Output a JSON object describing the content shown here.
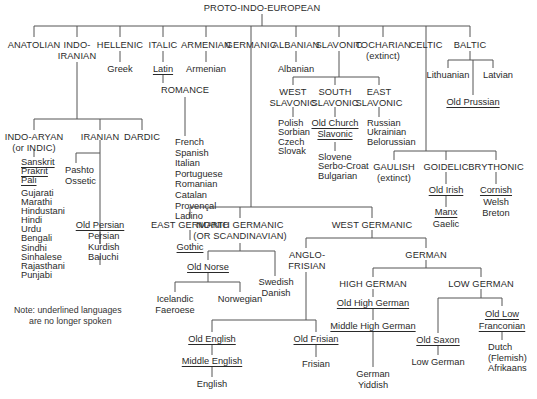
{
  "title": "PROTO-INDO-EUROPEAN",
  "note": {
    "line1": "Note: underlined languages",
    "line2": "are no longer spoken"
  },
  "branches": {
    "anatolian": "ANATOLIAN",
    "indo_iranian": [
      "INDO-",
      "IRANIAN"
    ],
    "hellenic": "HELLENIC",
    "italic": "ITALIC",
    "armenian": "ARMENIAN",
    "germanic": "GERMANIC",
    "albanian": "ALBANIAN",
    "slavonic": "SLAVONIC",
    "tocharian": [
      "TOCHARIAN",
      "(extinct)"
    ],
    "celtic": "CELTIC",
    "baltic": "BALTIC"
  },
  "hellenic": {
    "greek": "Greek"
  },
  "italic": {
    "latin": "Latin",
    "romance": "ROMANCE",
    "romance_langs": [
      "French",
      "Spanish",
      "Italian",
      "Portuguese",
      "Romanian",
      "Catalan",
      "Provençal",
      "Ladino"
    ]
  },
  "armenian": {
    "armenian": "Armenian"
  },
  "albanian": {
    "albanian": "Albanian"
  },
  "baltic": {
    "lithuanian": "Lithuanian",
    "latvian": "Latvian",
    "old_prussian": "Old Prussian"
  },
  "indo_iranian": {
    "indo_aryan": [
      "INDO-ARYAN",
      "(or INDIC)"
    ],
    "iranian": "IRANIAN",
    "dardic": "DARDIC",
    "extinct_indic": [
      "Sanskrit",
      "Prakrit",
      "Pali"
    ],
    "indic_langs": [
      "Gujarati",
      "Marathi",
      "Hindustani",
      "Hindi",
      "Urdu",
      "Bengali",
      "Sindhi",
      "Sinhalese",
      "Rajasthani",
      "Punjabi"
    ],
    "pashto_ossetic": [
      "Pashto",
      "Ossetic"
    ],
    "old_persian": "Old Persian",
    "persian_langs": [
      "Persian",
      "Kurdish",
      "Baluchi"
    ]
  },
  "slavonic": {
    "west": [
      "WEST",
      "SLAVONIC"
    ],
    "south": [
      "SOUTH",
      "SLAVONIC"
    ],
    "east": [
      "EAST",
      "SLAVONIC"
    ],
    "west_langs": [
      "Polish",
      "Sorbian",
      "Czech",
      "Slovak"
    ],
    "old_church": [
      "Old Church",
      "Slavonic"
    ],
    "south_langs": [
      "Slovene",
      "Serbo-Croat",
      "Bulgarian"
    ],
    "east_langs": [
      "Russian",
      "Ukrainian",
      "Belorussian"
    ]
  },
  "celtic": {
    "gaulish": [
      "GAULISH",
      "(extinct)"
    ],
    "goidelic": "GOIDELIC",
    "brythonic": "BRYTHONIC",
    "old_irish": "Old Irish",
    "manx": "Manx",
    "gaelic": "Gaelic",
    "cornish": "Cornish",
    "welsh_breton": [
      "Welsh",
      "Breton"
    ]
  },
  "germanic": {
    "east": "EAST GERMANIC",
    "gothic": "Gothic",
    "north": [
      "NORTH GERMANIC",
      "(OR SCANDINAVIAN)"
    ],
    "old_norse": "Old Norse",
    "swedish_danish": [
      "Swedish",
      "Danish"
    ],
    "icelandic_faeroese": [
      "Icelandic",
      "Faeroese"
    ],
    "norwegian": "Norwegian",
    "west": "WEST GERMANIC",
    "anglo_frisian": [
      "ANGLO-",
      "FRISIAN"
    ],
    "old_english": "Old English",
    "middle_english": "Middle English",
    "english": "English",
    "old_frisian": "Old Frisian",
    "frisian": "Frisian",
    "german": "GERMAN",
    "high_german": "HIGH GERMAN",
    "old_high_german": "Old High German",
    "middle_high_german": "Middle High German",
    "german_yiddish": [
      "German",
      "Yiddish"
    ],
    "low_german_branch": "LOW GERMAN",
    "old_saxon": "Old Saxon",
    "low_german": "Low German",
    "old_low_franconian": [
      "Old Low",
      "Franconian"
    ],
    "dutch_langs": [
      "Dutch",
      "(Flemish)",
      "Afrikaans"
    ]
  }
}
